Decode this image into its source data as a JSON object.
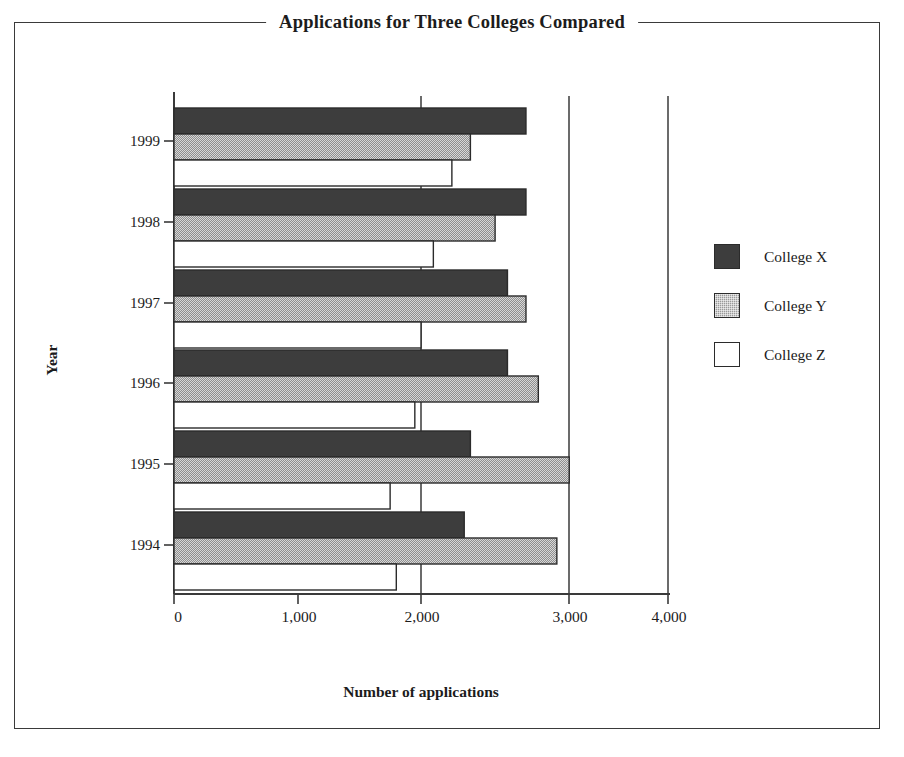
{
  "chart_data": {
    "type": "bar",
    "orientation": "horizontal",
    "title": "Applications for Three Colleges Compared",
    "xlabel": "Number of applications",
    "ylabel": "Year",
    "categories": [
      "1994",
      "1995",
      "1996",
      "1997",
      "1998",
      "1999"
    ],
    "series": [
      {
        "name": "College X",
        "color": "#3d3d3d",
        "fill": "solid-dark",
        "values": [
          2350,
          2400,
          2700,
          2700,
          2850,
          2850
        ]
      },
      {
        "name": "College Y",
        "color": "#9a9a9a",
        "fill": "gray-dotted",
        "values": [
          3100,
          3200,
          2950,
          2850,
          2600,
          2400
        ]
      },
      {
        "name": "College Z",
        "color": "#ffffff",
        "fill": "white-outline",
        "values": [
          1800,
          1750,
          1950,
          2000,
          2100,
          2250
        ]
      }
    ],
    "xlim": [
      0,
      4000
    ],
    "xticks": [
      0,
      1000,
      2000,
      3000,
      4000
    ],
    "xtick_labels": [
      "0",
      "1,000",
      "2,000",
      "3,000",
      "4,000"
    ],
    "grid": "vertical-at-2000-and-3000-and-4000",
    "legend_position": "right",
    "bar_order_within_group": "College X top, College Y middle, College Z bottom"
  },
  "legend": {
    "entries": [
      {
        "label": "College X",
        "swatch": "dark-filled-square"
      },
      {
        "label": "College Y",
        "swatch": "gray-dotted-square"
      },
      {
        "label": "College Z",
        "swatch": "white-outline-square"
      }
    ]
  },
  "axes": {
    "x_title": "Number of applications",
    "y_title": "Year"
  }
}
